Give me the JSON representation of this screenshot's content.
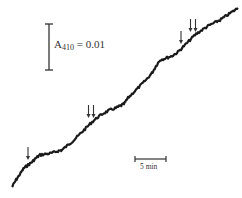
{
  "chart_data": {
    "type": "line",
    "title": "",
    "xlabel": "",
    "ylabel": "",
    "scale_bars": {
      "vertical": {
        "label_prefix": "A",
        "label_sub": "410",
        "label_suffix": " = 0.01",
        "value": 0.01,
        "unit": "A410"
      },
      "horizontal": {
        "label": "5 min",
        "value": 5,
        "unit": "min"
      }
    },
    "arrows": [
      {
        "type": "single",
        "x_px": 28,
        "count": 1
      },
      {
        "type": "double",
        "x_px": 91,
        "count": 2
      },
      {
        "type": "single",
        "x_px": 181,
        "count": 1
      },
      {
        "type": "double",
        "x_px": 193,
        "count": 2
      }
    ],
    "trace_points_px": [
      [
        12,
        187
      ],
      [
        16,
        180
      ],
      [
        20,
        174
      ],
      [
        24,
        168
      ],
      [
        28,
        165
      ],
      [
        32,
        162
      ],
      [
        36,
        158
      ],
      [
        40,
        155
      ],
      [
        46,
        154
      ],
      [
        52,
        153
      ],
      [
        58,
        151
      ],
      [
        62,
        150
      ],
      [
        68,
        145
      ],
      [
        74,
        140
      ],
      [
        80,
        134
      ],
      [
        86,
        128
      ],
      [
        92,
        122
      ],
      [
        98,
        117
      ],
      [
        104,
        113
      ],
      [
        110,
        110
      ],
      [
        116,
        108
      ],
      [
        120,
        106
      ],
      [
        124,
        104
      ],
      [
        128,
        98
      ],
      [
        134,
        92
      ],
      [
        140,
        86
      ],
      [
        146,
        80
      ],
      [
        152,
        73
      ],
      [
        156,
        66
      ],
      [
        160,
        60
      ],
      [
        166,
        58
      ],
      [
        172,
        56
      ],
      [
        178,
        52
      ],
      [
        184,
        46
      ],
      [
        190,
        40
      ],
      [
        196,
        34
      ],
      [
        202,
        30
      ],
      [
        208,
        26
      ],
      [
        214,
        23
      ],
      [
        220,
        20
      ],
      [
        226,
        16
      ],
      [
        232,
        12
      ],
      [
        238,
        8
      ]
    ],
    "colors": {
      "trace": "#1a1a1a",
      "arrows": "#333333",
      "bars": "#333333"
    }
  }
}
